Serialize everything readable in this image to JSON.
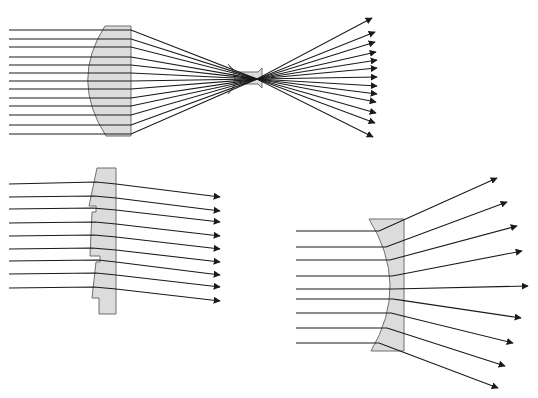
{
  "figure": {
    "width": 538,
    "height": 398,
    "background": "#ffffff",
    "lens_fill": "#dcdcdc",
    "lens_stroke": "#6e6e6e",
    "ray_color": "#1a1a1a"
  },
  "panels": [
    {
      "id": "converging-plano-convex",
      "lens_path": "M105,26 L131,26 L131,136 L106,136 Q70,80 105,26 Z",
      "secondary_lens_path": "M228,64 L236,72 L258,72 L262,68 L262,88 L258,84 L236,84 L228,94 Q242,79 228,64 Z",
      "rays": [
        {
          "y": 30,
          "hit": [
            104,
            30
          ],
          "end": [
            372,
            18
          ]
        },
        {
          "y": 39,
          "hit": [
            98,
            39
          ],
          "end": [
            375,
            32
          ]
        },
        {
          "y": 47,
          "hit": [
            94,
            47
          ],
          "end": [
            375,
            42
          ]
        },
        {
          "y": 57,
          "hit": [
            91,
            57
          ],
          "end": [
            376,
            52
          ]
        },
        {
          "y": 65,
          "hit": [
            89,
            65
          ],
          "end": [
            377,
            60
          ]
        },
        {
          "y": 73,
          "hit": [
            88,
            73
          ],
          "end": [
            377,
            68
          ]
        },
        {
          "y": 81,
          "hit": [
            88,
            81
          ],
          "end": [
            377,
            77
          ]
        },
        {
          "y": 89,
          "hit": [
            88,
            89
          ],
          "end": [
            377,
            86
          ]
        },
        {
          "y": 98,
          "hit": [
            89,
            98
          ],
          "end": [
            377,
            94
          ]
        },
        {
          "y": 106,
          "hit": [
            91,
            106
          ],
          "end": [
            376,
            102
          ]
        },
        {
          "y": 115,
          "hit": [
            95,
            115
          ],
          "end": [
            376,
            113
          ]
        },
        {
          "y": 125,
          "hit": [
            99,
            125
          ],
          "end": [
            375,
            123
          ]
        },
        {
          "y": 134,
          "hit": [
            105,
            134
          ],
          "end": [
            373,
            137
          ]
        }
      ],
      "ray_start_x": 9,
      "lens_exit_x": 131,
      "focus": [
        257,
        79
      ]
    },
    {
      "id": "fresnel-lens",
      "lens_path": "M97,168 L116,168 L116,314 L99,314 L99,298 L92,298 L96,262 L100,262 L100,256 L90,256 L92,212 L96,212 L96,206 L89,206 Z",
      "rays": [
        {
          "start": [
            9,
            184
          ],
          "hit": [
            96,
            182
          ],
          "exit": [
            116,
            184
          ],
          "end": [
            220,
            197
          ]
        },
        {
          "start": [
            9,
            197
          ],
          "hit": [
            94,
            196
          ],
          "exit": [
            116,
            198
          ],
          "end": [
            220,
            211
          ]
        },
        {
          "start": [
            9,
            209
          ],
          "hit": [
            93,
            208
          ],
          "exit": [
            116,
            210
          ],
          "end": [
            220,
            222
          ]
        },
        {
          "start": [
            9,
            223
          ],
          "hit": [
            95,
            222
          ],
          "exit": [
            116,
            224
          ],
          "end": [
            220,
            236
          ]
        },
        {
          "start": [
            9,
            236
          ],
          "hit": [
            94,
            235
          ],
          "exit": [
            116,
            237
          ],
          "end": [
            220,
            249
          ]
        },
        {
          "start": [
            9,
            249
          ],
          "hit": [
            92,
            248
          ],
          "exit": [
            116,
            250
          ],
          "end": [
            220,
            262
          ]
        },
        {
          "start": [
            9,
            261
          ],
          "hit": [
            98,
            260
          ],
          "exit": [
            116,
            262
          ],
          "end": [
            220,
            275
          ]
        },
        {
          "start": [
            9,
            274
          ],
          "hit": [
            96,
            273
          ],
          "exit": [
            116,
            275
          ],
          "end": [
            220,
            287
          ]
        },
        {
          "start": [
            9,
            288
          ],
          "hit": [
            94,
            287
          ],
          "exit": [
            116,
            289
          ],
          "end": [
            220,
            301
          ]
        }
      ]
    },
    {
      "id": "diverging-plano-concave",
      "lens_path": "M369,219 L404,219 L404,351 L371,351 Q410,285 369,219 Z",
      "rays": [
        {
          "y": 231,
          "hit": [
            379,
            231
          ],
          "end": [
            497,
            178
          ]
        },
        {
          "y": 247,
          "hit": [
            386,
            247
          ],
          "end": [
            507,
            202
          ]
        },
        {
          "y": 260,
          "hit": [
            390,
            260
          ],
          "end": [
            517,
            226
          ]
        },
        {
          "y": 276,
          "hit": [
            392,
            276
          ],
          "end": [
            522,
            251
          ]
        },
        {
          "y": 289,
          "hit": [
            393,
            289
          ],
          "end": [
            528,
            286
          ]
        },
        {
          "y": 299,
          "hit": [
            393,
            299
          ],
          "end": [
            521,
            318
          ]
        },
        {
          "y": 313,
          "hit": [
            391,
            313
          ],
          "end": [
            513,
            343
          ]
        },
        {
          "y": 328,
          "hit": [
            387,
            328
          ],
          "end": [
            505,
            366
          ]
        },
        {
          "y": 343,
          "hit": [
            379,
            343
          ],
          "end": [
            498,
            388
          ]
        }
      ],
      "ray_start_x": 296,
      "lens_exit_x": 404
    }
  ]
}
